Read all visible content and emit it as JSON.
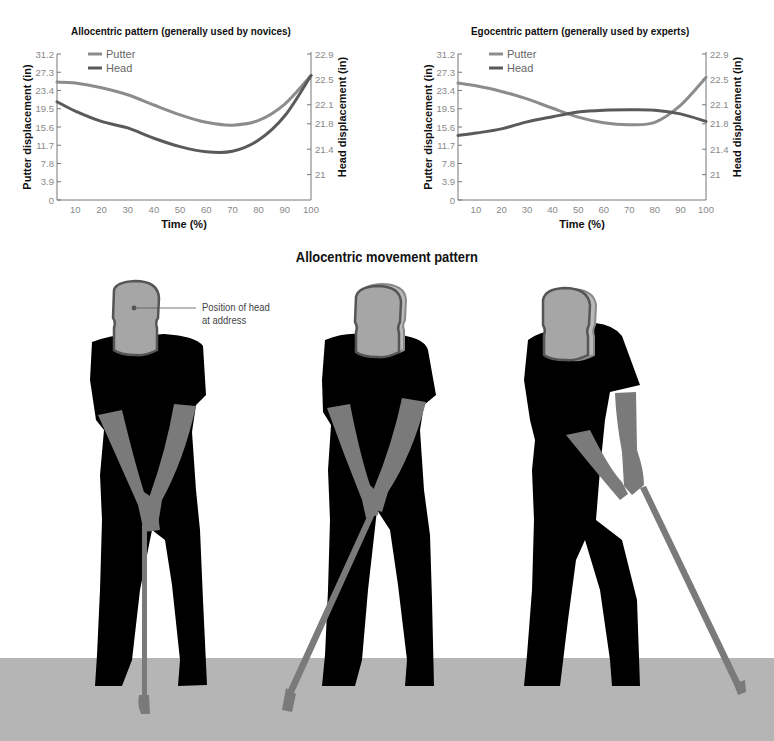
{
  "colors": {
    "putter": "#8c8c8c",
    "head": "#5a5a5a",
    "axis": "#777777",
    "tick_text": "#888888",
    "silhouette": "#000000",
    "skin": "#7a7a7a",
    "head_fill": "#a6a6a6",
    "head_outline": "#555555",
    "ground": "#b5b5b5"
  },
  "section_title": "Allocentric movement pattern",
  "annotation": {
    "line1": "Position of head",
    "line2": "at address"
  },
  "chart_data": [
    {
      "type": "line",
      "title": "Allocentric pattern (generally used by novices)",
      "xlabel": "Time (%)",
      "ylabel": "Putter displacement (in)",
      "y2label": "Head displacement (in)",
      "x_ticks": [
        "10",
        "20",
        "30",
        "40",
        "50",
        "60",
        "70",
        "80",
        "90",
        "100"
      ],
      "y_ticks": [
        "0",
        "3.9",
        "7.8",
        "11.7",
        "15.6",
        "19.5",
        "23.4",
        "27.3",
        "31.2"
      ],
      "y2_ticks": [
        "21",
        "21.4",
        "21.8",
        "22.1",
        "22.5",
        "22.9"
      ],
      "xlim": [
        3,
        100
      ],
      "ylim": [
        0,
        31.2
      ],
      "y2lim": [
        20.6,
        22.9
      ],
      "grid": false,
      "legend": {
        "position": "top-left",
        "entries": [
          "Putter",
          "Head"
        ]
      },
      "x": [
        3,
        10,
        20,
        30,
        40,
        50,
        60,
        70,
        80,
        90,
        100
      ],
      "series": [
        {
          "name": "Putter",
          "axis": "left",
          "values": [
            25.2,
            25.0,
            24.0,
            22.5,
            20.3,
            18.2,
            16.6,
            16.0,
            17.0,
            20.5,
            26.6
          ]
        },
        {
          "name": "Head",
          "axis": "left",
          "values": [
            21.0,
            19.0,
            16.8,
            15.4,
            13.2,
            11.4,
            10.3,
            10.4,
            12.8,
            18.0,
            26.6
          ]
        }
      ]
    },
    {
      "type": "line",
      "title": "Egocentric pattern (generally used by experts)",
      "xlabel": "Time (%)",
      "ylabel": "Putter displacement (in)",
      "y2label": "Head displacement (in)",
      "x_ticks": [
        "10",
        "20",
        "30",
        "40",
        "50",
        "60",
        "70",
        "80",
        "90",
        "100"
      ],
      "y_ticks": [
        "0",
        "3.9",
        "7.8",
        "11.7",
        "15.6",
        "19.5",
        "23.4",
        "27.3",
        "31.2"
      ],
      "y2_ticks": [
        "21",
        "21.4",
        "21.8",
        "22.1",
        "22.5",
        "22.9"
      ],
      "xlim": [
        3,
        100
      ],
      "ylim": [
        0,
        31.2
      ],
      "y2lim": [
        20.6,
        22.9
      ],
      "grid": false,
      "legend": {
        "position": "top-left",
        "entries": [
          "Putter",
          "Head"
        ]
      },
      "x": [
        3,
        10,
        20,
        30,
        40,
        50,
        60,
        70,
        80,
        90,
        100
      ],
      "series": [
        {
          "name": "Putter",
          "axis": "left",
          "values": [
            25.0,
            24.4,
            23.2,
            21.6,
            19.6,
            17.7,
            16.5,
            16.1,
            16.6,
            20.2,
            26.2
          ]
        },
        {
          "name": "Head",
          "axis": "left",
          "values": [
            13.8,
            14.3,
            15.2,
            16.7,
            17.8,
            18.8,
            19.2,
            19.3,
            19.2,
            18.4,
            16.8
          ]
        }
      ]
    }
  ]
}
